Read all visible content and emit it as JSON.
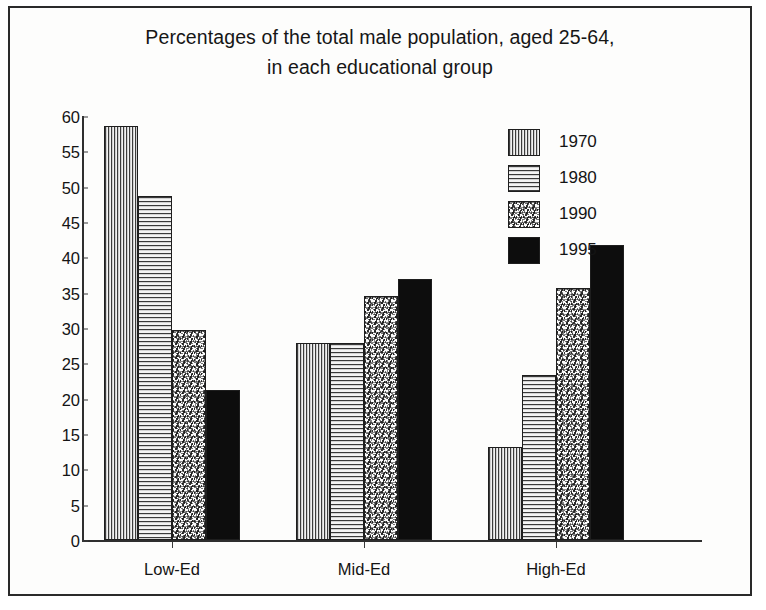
{
  "chart_data": {
    "type": "bar",
    "title": "Percentages of the total male population, aged 25-64, in each educational group",
    "title_line1": "Percentages of the total male population, aged 25-64,",
    "title_line2": "in each educational group",
    "xlabel": "",
    "ylabel": "",
    "ylim": [
      0,
      60
    ],
    "ytick_step": 5,
    "yticks": [
      60,
      55,
      50,
      45,
      40,
      35,
      30,
      25,
      20,
      15,
      10,
      5,
      0
    ],
    "grid": false,
    "legend_position": "upper-right-inside",
    "categories": [
      "Low-Ed",
      "Mid-Ed",
      "High-Ed"
    ],
    "series": [
      {
        "name": "1970",
        "values": [
          58.6,
          27.9,
          13.2
        ],
        "pattern": "vertical-stripes",
        "color": "#3c3c3c"
      },
      {
        "name": "1980",
        "values": [
          48.7,
          27.9,
          23.4
        ],
        "pattern": "horizontal-stripes",
        "color": "#3a3a3a"
      },
      {
        "name": "1990",
        "values": [
          29.7,
          34.5,
          35.7
        ],
        "pattern": "speckle",
        "color": "#1a1a1a"
      },
      {
        "name": "1995",
        "values": [
          21.2,
          37.0,
          41.7
        ],
        "pattern": "solid-black",
        "color": "#0d0d0d"
      }
    ]
  },
  "legend": {
    "entries": [
      {
        "label": "1970"
      },
      {
        "label": "1980"
      },
      {
        "label": "1990"
      },
      {
        "label": "1995"
      }
    ]
  }
}
